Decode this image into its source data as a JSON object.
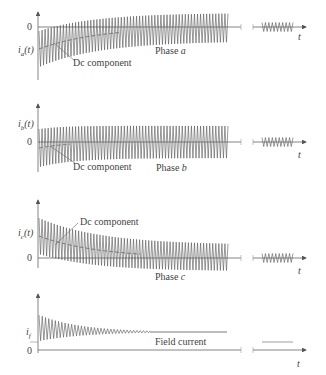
{
  "figure": {
    "panels": [
      {
        "id": "a",
        "ylabel": "i",
        "ysub": "a",
        "yarg": "(t)",
        "zero_label": "0",
        "dc_label": "Dc component",
        "phase_label": "Phase ",
        "phase_letter": "a",
        "t_label": "t"
      },
      {
        "id": "b",
        "ylabel": "i",
        "ysub": "b",
        "yarg": "(t)",
        "zero_label": "0",
        "dc_label": "Dc component",
        "phase_label": "Phase ",
        "phase_letter": "b",
        "t_label": "t"
      },
      {
        "id": "c",
        "ylabel": "i",
        "ysub": "c",
        "yarg": "(t)",
        "zero_label": "0",
        "dc_label": "Dc component",
        "phase_label": "Phase ",
        "phase_letter": "c",
        "t_label": "t"
      },
      {
        "id": "f",
        "ylabel": "i",
        "ysub": "f",
        "yarg": "",
        "zero_label": "0",
        "caption": "Field current",
        "t_label": "t"
      }
    ],
    "colors": {
      "trace": "#555555",
      "axis": "#666666",
      "dc": "#777777",
      "text": "#444444"
    }
  }
}
